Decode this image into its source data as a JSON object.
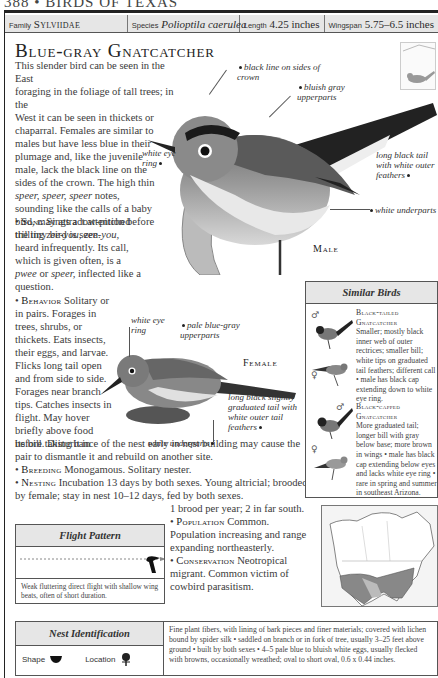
{
  "running_head": "388 • BIRDS OF TEXAS",
  "infobar": {
    "family_label": "Family",
    "family_value": "Sylviidae",
    "species_label": "Species",
    "species_value": "Polioptila caerulea",
    "length_label": "Length",
    "length_value": "4.25 inches",
    "wingspan_label": "Wingspan",
    "wingspan_value": "5.75–6.5 inches"
  },
  "title": "Blue-gray Gnatcatcher",
  "intro": {
    "line1": "This slender bird can be seen in the East",
    "line2": "foraging in the foliage of tall trees; in the",
    "line3": "West it can be seen in thickets or",
    "rest_before": "chaparral. Females are similar to males but have less blue in their plumage and, like the juvenile male, lack the black line on the sides of the crown. The high thin ",
    "call_italic": "speer, speer, speer",
    "rest_after": " notes, sounding like the calls of a baby bird, may attract attention before the tiny bird is seen."
  },
  "sections": {
    "song": {
      "heading": "Song",
      "text_before": "Sings a low-pitched trilling ",
      "italic1": "zee-you, zee-you,",
      "text_mid": " heard infrequently. Its call, which is given often, is a ",
      "italic2": "pwee",
      "text_or": " or ",
      "italic3": "speer,",
      "text_after": " inflected like a question."
    },
    "behavior": {
      "heading": "Behavior",
      "text": "Solitary or in pairs. Forages in trees, shrubs, or thickets. Eats insects, their eggs, and larvae. Flicks long tail open and from side to side. Forages near branch tips. Catches insects in flight. May hover briefly above food before taking it in",
      "continued": "its bill. Disturbance of the nest early in nest building may cause the pair to dismantle it and rebuild on another site."
    },
    "breeding": {
      "heading": "Breeding",
      "text": "Monogamous. Solitary nester."
    },
    "nesting": {
      "heading": "Nesting",
      "text": "Incubation 13 days by both sexes. Young altricial; brooded by female; stay in nest 10–12 days, fed by both sexes.",
      "continued": "1 brood per year; 2 in far south."
    },
    "population": {
      "heading": "Population",
      "text": "Common. Population increasing and range expanding northeasterly."
    },
    "conservation": {
      "heading": "Conservation",
      "text": "Neotropical migrant. Common victim of cowbird parasitism."
    }
  },
  "male_figure": {
    "label": "Male",
    "annotations": {
      "crown": "black line on sides of crown",
      "upperparts": "bluish gray upperparts",
      "eye_ring": "white eye ring",
      "tail": "long black tail with white outer feathers",
      "underparts": "white underparts"
    }
  },
  "female_figure": {
    "label": "Female",
    "annotations": {
      "eye_ring": "white eye ring",
      "upperparts": "pale blue-gray upperparts",
      "tail": "long black slightly graduated tail with white outer tail feathers",
      "underparts": "white underparts"
    }
  },
  "similar_birds": {
    "heading": "Similar Birds",
    "items": [
      {
        "name": "Black-tailed Gnatcatcher",
        "description": "Smaller; mostly black inner web of outer rectrices; smaller bill; white tips on graduated tail feathers; different call • male has black cap extending down to white eye ring.",
        "male_symbol": "♂",
        "female_symbol": "♀"
      },
      {
        "name": "Black-capped Gnatcatcher",
        "description": "More graduated tail; longer bill with gray below base; more brown in wings • male has black cap extending below eyes and lacks white eye ring • rare in spring and summer in southeast Arizona.",
        "male_symbol": "♂",
        "female_symbol": "♀"
      }
    ]
  },
  "flight_pattern": {
    "heading": "Flight Pattern",
    "caption": "Weak fluttering direct flight with shallow wing beats, often of short duration."
  },
  "nest_identification": {
    "heading": "Nest Identification",
    "shape_label": "Shape",
    "location_label": "Location",
    "description": "Fine plant fibers, with lining of bark pieces and finer materials; covered with lichen bound by spider silk • saddled on branch or in fork of tree, usually 3–25 feet above ground • built by both sexes • 4–5 pale blue to bluish white eggs, usually flecked with browns, occasionally wreathed; oval to short oval, 0.6 x 0.44 inches."
  },
  "range_map": {
    "label": "North America range map"
  }
}
